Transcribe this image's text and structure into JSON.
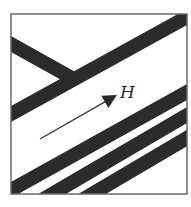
{
  "diagram": {
    "type": "domain-stripes-with-field",
    "frame": {
      "x": 11,
      "y": 14,
      "width": 176,
      "height": 180,
      "stroke": "#6a6a6a"
    },
    "stripe_color": "#2b2b2b",
    "stripe_width": 14,
    "stripes": [
      {
        "id": "upper-left-branch",
        "x1": 11,
        "y1": 44,
        "x2": 72,
        "y2": 78
      },
      {
        "id": "upper-long",
        "x1": 11,
        "y1": 114,
        "x2": 187,
        "y2": 17
      },
      {
        "id": "lower-1",
        "x1": 11,
        "y1": 190,
        "x2": 187,
        "y2": 92
      },
      {
        "id": "lower-2",
        "x1": 52,
        "y1": 194,
        "x2": 187,
        "y2": 115
      },
      {
        "id": "lower-3",
        "x1": 92,
        "y1": 194,
        "x2": 187,
        "y2": 138
      }
    ],
    "field_arrow": {
      "x1": 40,
      "y1": 139,
      "x2": 117,
      "y2": 95,
      "color": "#3a3a3a",
      "label": "H",
      "label_x": 120,
      "label_y": 98
    }
  }
}
